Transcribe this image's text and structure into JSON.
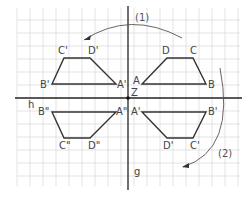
{
  "diagram": {
    "type": "reflection-on-two-perpendicular-axes",
    "colors": {
      "grid": "#dcdcdc",
      "axis": "#222222",
      "shape": "#333333",
      "label": "#444444",
      "arrow": "#555555"
    },
    "axes": {
      "horizontal_label": "h",
      "vertical_label": "g",
      "center_label": "Z"
    },
    "arrows": [
      {
        "label": "(1)"
      },
      {
        "label": "(2)"
      }
    ],
    "shapes": [
      {
        "name": "original",
        "vertices": [
          {
            "label": "A"
          },
          {
            "label": "B"
          },
          {
            "label": "C"
          },
          {
            "label": "D"
          }
        ]
      },
      {
        "name": "reflection-over-g",
        "vertices": [
          {
            "label": "A'"
          },
          {
            "label": "B'"
          },
          {
            "label": "C'"
          },
          {
            "label": "D'"
          }
        ]
      },
      {
        "name": "reflection-over-h",
        "vertices": [
          {
            "label": "A'"
          },
          {
            "label": "B'"
          },
          {
            "label": "C'"
          },
          {
            "label": "D'"
          }
        ]
      },
      {
        "name": "double-reflection",
        "vertices": [
          {
            "label": "A\""
          },
          {
            "label": "B\""
          },
          {
            "label": "C\""
          },
          {
            "label": "D\""
          }
        ]
      }
    ]
  }
}
